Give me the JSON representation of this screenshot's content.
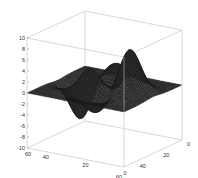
{
  "chart_data": {
    "type": "surface",
    "title": "",
    "xlabel": "",
    "ylabel": "",
    "zlabel": "",
    "function": "peaks",
    "grid_size": 49,
    "x_range": [
      0,
      49
    ],
    "y_range": [
      0,
      49
    ],
    "z_range": [
      -10,
      10
    ],
    "z_ticks": [
      10,
      8,
      6,
      4,
      2,
      0,
      -2,
      -4,
      -6,
      -8,
      -10
    ],
    "x_ticks": [
      60,
      40,
      20,
      0
    ],
    "y_ticks": [
      0,
      20,
      40,
      60
    ],
    "z_max_approx": 8.1,
    "z_min_approx": -6.5,
    "mesh_color": "#1a1a1a",
    "surface_color": "#2b2b2b",
    "grid": false,
    "box": true,
    "legend": "none"
  },
  "axes": {
    "z_tick_labels": [
      "10",
      "8",
      "6",
      "4",
      "2",
      "0",
      "-2",
      "-4",
      "-6",
      "-8",
      "-10"
    ],
    "x_tick_labels": [
      "60",
      "40",
      "20",
      "0"
    ],
    "y_tick_labels": [
      "0",
      "20",
      "40",
      "60"
    ],
    "box_color": "#bdbdbd"
  }
}
